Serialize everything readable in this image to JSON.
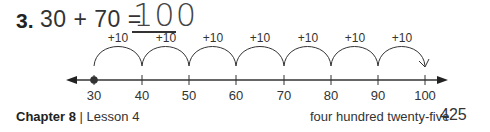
{
  "problem": {
    "number": "3.",
    "equation": "30 + 70 =",
    "answer": "100"
  },
  "number_line": {
    "ticks": [
      {
        "label": "30",
        "x": 94
      },
      {
        "label": "40",
        "x": 142
      },
      {
        "label": "50",
        "x": 189
      },
      {
        "label": "60",
        "x": 236
      },
      {
        "label": "70",
        "x": 284
      },
      {
        "label": "80",
        "x": 331
      },
      {
        "label": "90",
        "x": 378
      },
      {
        "label": "100",
        "x": 425
      }
    ],
    "jumps": [
      "+10",
      "+10",
      "+10",
      "+10",
      "+10",
      "+10",
      "+10"
    ],
    "start_point": "30"
  },
  "footer": {
    "chapter": "Chapter 8",
    "separator": "|",
    "lesson": "Lesson 4",
    "page_words": "four hundred twenty-five",
    "page_number": "425"
  }
}
